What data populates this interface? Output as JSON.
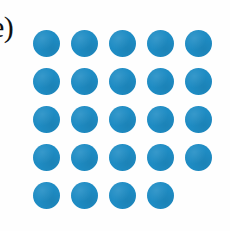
{
  "figure": {
    "panel_label": "e)",
    "background_color": "#fefefe",
    "width_px": 230,
    "height_px": 231
  },
  "chart_data": {
    "type": "scatter",
    "title": "e)",
    "subtitle": "",
    "xlabel": "",
    "ylabel": "",
    "annotations": [
      "e)"
    ],
    "legend": [],
    "grid": false,
    "marker": {
      "shape": "circle",
      "fill_color": "#1e8cc4",
      "edge_color": "none",
      "diameter_px": 27
    },
    "layout": {
      "columns": 5,
      "rows": 5,
      "column_pitch_px": 38,
      "row_pitch_px": 38,
      "origin_x_px": 33,
      "origin_y_px": 30,
      "total_markers": 24
    },
    "x": [
      1,
      2,
      3,
      4,
      5,
      1,
      2,
      3,
      4,
      5,
      1,
      2,
      3,
      4,
      5,
      1,
      2,
      3,
      4,
      5,
      1,
      2,
      3,
      4
    ],
    "y": [
      5,
      5,
      5,
      5,
      5,
      4,
      4,
      4,
      4,
      4,
      3,
      3,
      3,
      3,
      3,
      2,
      2,
      2,
      2,
      2,
      1,
      1,
      1,
      1
    ],
    "xlim": [
      0,
      6
    ],
    "ylim": [
      0,
      6
    ],
    "rows_data": [
      {
        "row_index": 1,
        "count": 5,
        "columns": [
          1,
          2,
          3,
          4,
          5
        ]
      },
      {
        "row_index": 2,
        "count": 5,
        "columns": [
          1,
          2,
          3,
          4,
          5
        ]
      },
      {
        "row_index": 3,
        "count": 5,
        "columns": [
          1,
          2,
          3,
          4,
          5
        ]
      },
      {
        "row_index": 4,
        "count": 5,
        "columns": [
          1,
          2,
          3,
          4,
          5
        ]
      },
      {
        "row_index": 5,
        "count": 4,
        "columns": [
          1,
          2,
          3,
          4
        ]
      }
    ]
  }
}
